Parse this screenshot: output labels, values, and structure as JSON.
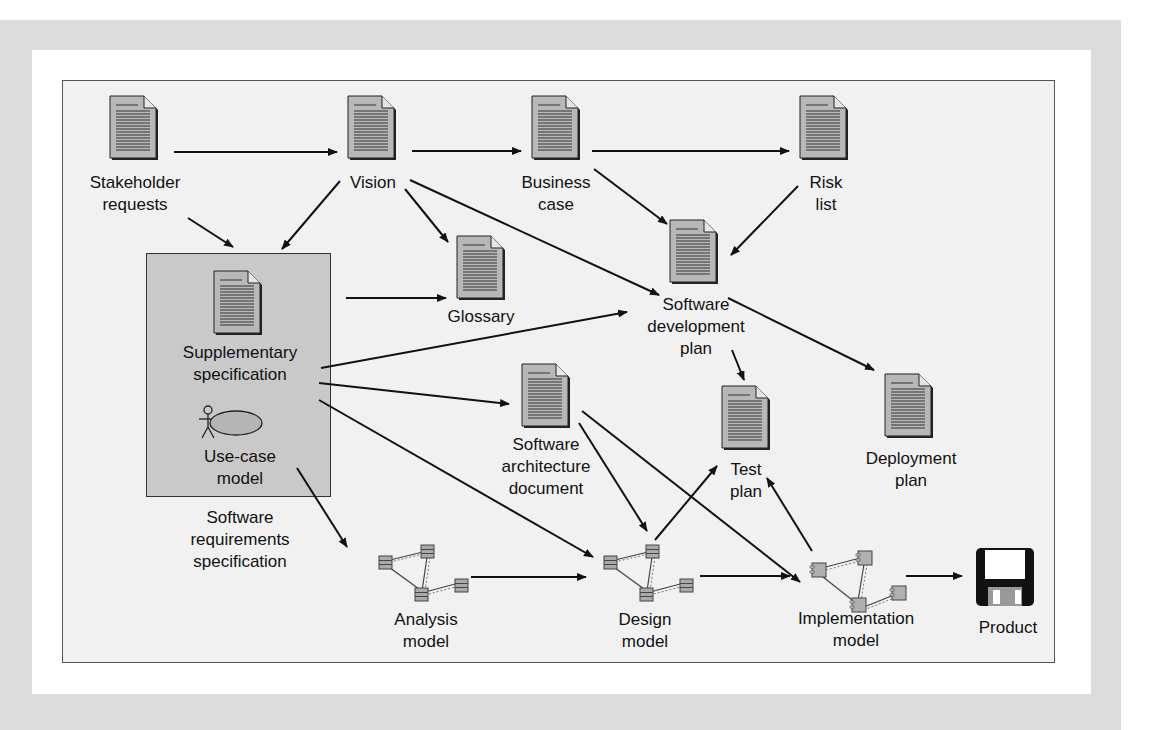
{
  "artifacts": {
    "stakeholder_requests": {
      "line1": "Stakeholder",
      "line2": "requests",
      "icon": "document-icon"
    },
    "vision": {
      "line1": "Vision",
      "icon": "document-icon"
    },
    "business_case": {
      "line1": "Business",
      "line2": "case",
      "icon": "document-icon"
    },
    "risk_list": {
      "line1": "Risk",
      "line2": "list",
      "icon": "document-icon"
    },
    "glossary": {
      "line1": "Glossary",
      "icon": "document-icon"
    },
    "software_development_plan": {
      "line1": "Software",
      "line2": "development",
      "line3": "plan",
      "icon": "document-icon"
    },
    "supplementary_specification": {
      "line1": "Supplementary",
      "line2": "specification",
      "icon": "document-icon"
    },
    "use_case_model": {
      "line1": "Use-case",
      "line2": "model",
      "icon": "use-case-icon"
    },
    "software_requirements_specification": {
      "line1": "Software",
      "line2": "requirements",
      "line3": "specification"
    },
    "software_architecture_document": {
      "line1": "Software",
      "line2": "architecture",
      "line3": "document",
      "icon": "document-icon"
    },
    "test_plan": {
      "line1": "Test",
      "line2": "plan",
      "icon": "document-icon"
    },
    "deployment_plan": {
      "line1": "Deployment",
      "line2": "plan",
      "icon": "document-icon"
    },
    "analysis_model": {
      "line1": "Analysis",
      "line2": "model",
      "icon": "class-diagram-icon"
    },
    "design_model": {
      "line1": "Design",
      "line2": "model",
      "icon": "class-diagram-icon"
    },
    "implementation_model": {
      "line1": "Implementation",
      "line2": "model",
      "icon": "component-diagram-icon"
    },
    "product": {
      "line1": "Product",
      "icon": "floppy-disk-icon"
    }
  },
  "edges": [
    {
      "from": "Stakeholder requests",
      "to": "Vision"
    },
    {
      "from": "Stakeholder requests",
      "to": "Software requirements specification"
    },
    {
      "from": "Vision",
      "to": "Business case"
    },
    {
      "from": "Vision",
      "to": "Software requirements specification"
    },
    {
      "from": "Vision",
      "to": "Glossary"
    },
    {
      "from": "Vision",
      "to": "Software development plan"
    },
    {
      "from": "Business case",
      "to": "Risk list"
    },
    {
      "from": "Business case",
      "to": "Software development plan"
    },
    {
      "from": "Risk list",
      "to": "Software development plan"
    },
    {
      "from": "Software requirements specification",
      "to": "Glossary"
    },
    {
      "from": "Supplementary specification",
      "to": "Software development plan"
    },
    {
      "from": "Supplementary specification",
      "to": "Software architecture document"
    },
    {
      "from": "Supplementary specification",
      "to": "Design model"
    },
    {
      "from": "Use-case model",
      "to": "Analysis model"
    },
    {
      "from": "Software development plan",
      "to": "Test plan"
    },
    {
      "from": "Software development plan",
      "to": "Deployment plan"
    },
    {
      "from": "Software architecture document",
      "to": "Design model"
    },
    {
      "from": "Software architecture document",
      "to": "Implementation model"
    },
    {
      "from": "Analysis model",
      "to": "Design model"
    },
    {
      "from": "Design model",
      "to": "Test plan"
    },
    {
      "from": "Design model",
      "to": "Implementation model"
    },
    {
      "from": "Implementation model",
      "to": "Test plan"
    },
    {
      "from": "Implementation model",
      "to": "Product"
    }
  ],
  "colors": {
    "outer_background": "#dcdcdc",
    "panel": "#ffffff",
    "diagram_background": "#f1f1f1",
    "srs_box": "#c9c9c9",
    "document_fill": "#b8b8b8",
    "ink": "#111111"
  }
}
